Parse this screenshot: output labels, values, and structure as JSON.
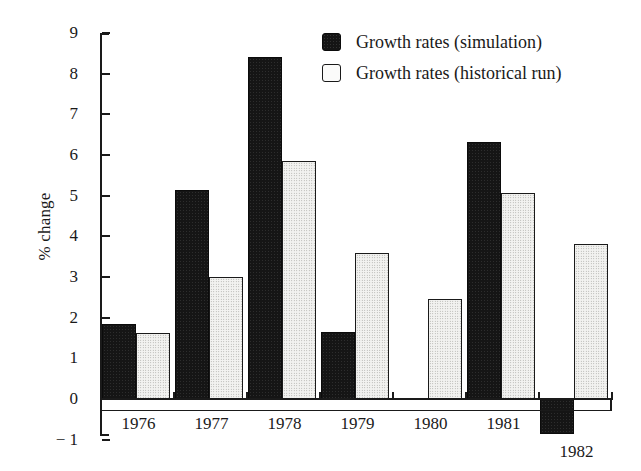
{
  "chart_data": {
    "type": "bar",
    "title": "",
    "xlabel": "",
    "ylabel": "% change",
    "ylim": [
      -1,
      9
    ],
    "yticks": [
      9,
      8,
      7,
      6,
      5,
      4,
      3,
      2,
      1,
      0,
      -1
    ],
    "ytick_labels": [
      "9",
      "8",
      "7",
      "6",
      "5",
      "4",
      "3",
      "2",
      "1",
      "0",
      "− 1"
    ],
    "grid": false,
    "legend_position": "top-right",
    "categories": [
      "1976",
      "1977",
      "1978",
      "1979",
      "1980",
      "1981",
      "1982"
    ],
    "series": [
      {
        "name": "Growth rates (simulation)",
        "color": "#151515",
        "values": [
          1.85,
          5.13,
          8.4,
          1.65,
          null,
          6.33,
          -0.85
        ]
      },
      {
        "name": "Growth rates (historical run)",
        "color": "#f2f2f0",
        "values": [
          1.62,
          3.0,
          5.85,
          3.6,
          2.45,
          5.07,
          3.8
        ]
      }
    ]
  },
  "legend": {
    "entries": [
      {
        "label": "Growth rates (simulation)",
        "swatch": "dark-filled-square-icon"
      },
      {
        "label": "Growth rates (historical run)",
        "swatch": "light-outlined-square-icon"
      }
    ]
  },
  "axes": {
    "y_title": "% change",
    "y_tick_labels": [
      "9",
      "8",
      "7",
      "6",
      "5",
      "4",
      "3",
      "2",
      "1",
      "0",
      "− 1"
    ],
    "x_tick_labels": [
      "1976",
      "1977",
      "1978",
      "1979",
      "1980",
      "1981",
      "1982"
    ]
  }
}
